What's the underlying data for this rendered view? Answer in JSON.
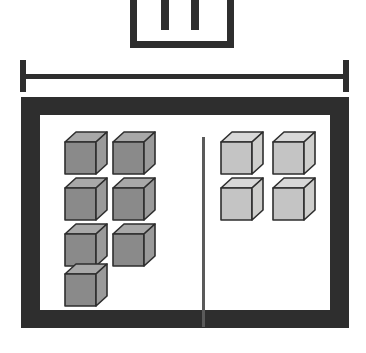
{
  "figure": {
    "type": "line-drawing",
    "background_color": "#ffffff",
    "ink_color": "#2e2e2e"
  },
  "bracket": {
    "name": "top-bracket",
    "shape": "u-bracket-with-two-prongs",
    "prong_count": 2,
    "color": "#2e2e2e"
  },
  "span_bar": {
    "name": "width-dimension-bar",
    "shape": "line-with-end-caps",
    "color": "#2e2e2e"
  },
  "tray": {
    "name": "tray-frame",
    "frame_color": "#2e2e2e",
    "interior_color": "#ffffff",
    "divider_color": "#5a5a5a"
  },
  "cube_style": {
    "dark": {
      "top": "#a8a8a8",
      "front": "#8a8a8a",
      "side": "#9a9a9a",
      "outline": "#2e2e2e"
    },
    "light": {
      "top": "#d8d8d8",
      "front": "#c4c4c4",
      "side": "#cececc",
      "outline": "#2e2e2e"
    }
  },
  "groups": [
    {
      "name": "left-group",
      "side": "left",
      "shade": "dark",
      "count": 7,
      "cubes": [
        {
          "x": 24,
          "y": 16
        },
        {
          "x": 72,
          "y": 16
        },
        {
          "x": 24,
          "y": 62
        },
        {
          "x": 72,
          "y": 62
        },
        {
          "x": 24,
          "y": 108
        },
        {
          "x": 72,
          "y": 108
        },
        {
          "x": 24,
          "y": 148
        }
      ]
    },
    {
      "name": "right-group",
      "side": "right",
      "shade": "light",
      "count": 4,
      "cubes": [
        {
          "x": 180,
          "y": 16
        },
        {
          "x": 232,
          "y": 16
        },
        {
          "x": 180,
          "y": 62
        },
        {
          "x": 232,
          "y": 62
        }
      ]
    }
  ],
  "chart_data": {
    "type": "bar",
    "categories": [
      "Left compartment",
      "Right compartment"
    ],
    "values": [
      7,
      4
    ],
    "xlabel": "Compartment",
    "ylabel": "Number of cubes",
    "ylim": [
      0,
      8
    ],
    "grid": false,
    "legend": "none"
  }
}
